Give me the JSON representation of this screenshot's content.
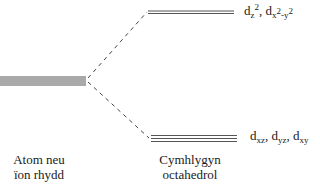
{
  "diagram": {
    "type": "crystal-field-splitting",
    "left_label": {
      "line1": "Atom neu",
      "line2": "ïon rhydd"
    },
    "right_label": {
      "line1": "Cymhlygyn",
      "line2": "octahedrol"
    },
    "upper_orbitals": {
      "a_base": "d",
      "a_sub": "z",
      "a_sup": "2",
      "sep": ", ",
      "b_base": "d",
      "b_sub1": "x",
      "b_sup1": "2",
      "b_mid": "-y",
      "b_sup2": "2"
    },
    "lower_orbitals": {
      "base": "d",
      "s1": "xz",
      "s2": "yz",
      "s3": "xy",
      "sep": ", "
    },
    "colors": {
      "line": "#555555",
      "text": "#1a1a1a"
    }
  }
}
